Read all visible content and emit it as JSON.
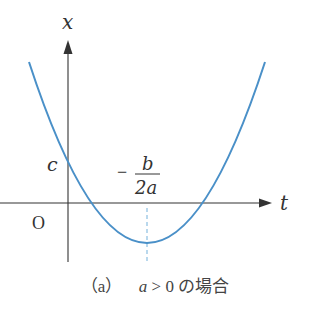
{
  "figure": {
    "axes": {
      "vertical_label": "x",
      "horizontal_label": "t",
      "origin_label": "O",
      "intercept_label": "c",
      "vertex_label": {
        "sign": "−",
        "numerator": "b",
        "denominator": "2a"
      }
    },
    "colors": {
      "curve": "#4a90c8",
      "axis": "#333333",
      "dashed_line": "#9cc8e6",
      "text": "#333333"
    },
    "caption": {
      "tag": "（a）",
      "condition_var": "a",
      "condition_rest": " > 0 の場合"
    }
  }
}
